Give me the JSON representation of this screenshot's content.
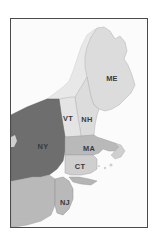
{
  "figure": {
    "kind": "map-figure",
    "background_color": "#ffffff",
    "frame": {
      "border_color": "#4a4a4a",
      "border_width_px": 1,
      "fill_color": "#fbfbfb"
    }
  },
  "map": {
    "region_name": "Northeastern United States",
    "projection_note": "",
    "ocean_color": "#fbfbfb",
    "border_line_color": "#9a9a9a",
    "legend_position": "none",
    "shades": {
      "dark_gray": "#6e6e6e",
      "medium_gray": "#b9b9b9",
      "light_gray": "#dcdcdc",
      "pale_gray": "#cfcfcf",
      "very_light_gray": "#e4e4e4"
    },
    "states": [
      {
        "code": "ME",
        "name": "Maine",
        "label": "ME",
        "fill": "#dcdcdc",
        "label_x": 101,
        "label_y": 60
      },
      {
        "code": "VT",
        "name": "Vermont",
        "label": "VT",
        "fill": "#e4e4e4",
        "label_x": 57,
        "label_y": 100
      },
      {
        "code": "NH",
        "name": "New Hampshire",
        "label": "NH",
        "fill": "#dcdcdc",
        "label_x": 76,
        "label_y": 101
      },
      {
        "code": "MA",
        "name": "Massachusetts",
        "label": "MA",
        "fill": "#b9b9b9",
        "label_x": 78,
        "label_y": 130
      },
      {
        "code": "CT",
        "name": "Connecticut",
        "label": "CT",
        "fill": "#cfcfcf",
        "label_x": 69,
        "label_y": 148
      },
      {
        "code": "NY",
        "name": "New York",
        "label": "NY",
        "fill": "#6e6e6e",
        "label_x": 32,
        "label_y": 128
      },
      {
        "code": "NJ",
        "name": "New Jersey",
        "label": "NJ",
        "fill": "#b9b9b9",
        "label_x": 54,
        "label_y": 184
      }
    ],
    "unlabeled_regions": [
      {
        "name": "Pennsylvania",
        "fill": "#b9b9b9"
      },
      {
        "name": "Canada",
        "fill": "#e8e8e8"
      },
      {
        "name": "Rhode Island",
        "fill": "#cfcfcf"
      },
      {
        "name": "Long Island",
        "fill": "#cfcfcf"
      }
    ],
    "scale_note": ""
  }
}
